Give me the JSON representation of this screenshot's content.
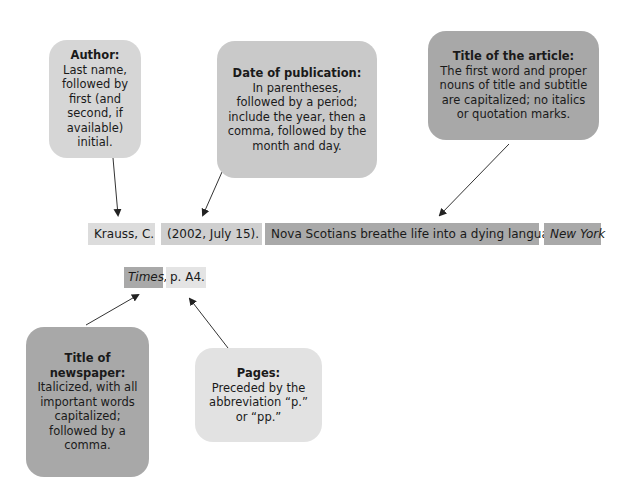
{
  "callouts": {
    "author": {
      "heading": "Author:",
      "body": "Last name, followed by first (and second, if available) initial.",
      "color": "#d6d6d6"
    },
    "date": {
      "heading": "Date of publication:",
      "body": "In parentheses, followed by a period; include the year, then a comma, followed by the month and day.",
      "color": "#c9c9c9"
    },
    "article_title": {
      "heading": "Title of the article:",
      "body": "The first word and proper nouns of title and subtitle are capitalized; no italics or quotation marks.",
      "color": "#a8a8a8"
    },
    "newspaper_title": {
      "heading": "Title of newspaper:",
      "body": "Italicized, with all important words capitalized; followed by a comma.",
      "color": "#a8a8a8"
    },
    "pages": {
      "heading": "Pages:",
      "body": "Preceded by the abbreviation “p.” or “pp.”",
      "color": "#e2e2e2"
    }
  },
  "citation": {
    "author": "Krauss, C.",
    "date": "(2002, July 15).",
    "article_title": "Nova Scotians breathe life into a dying language.",
    "newspaper_part1": "New York",
    "newspaper_part2": "Times,",
    "pages": "p. A4."
  }
}
